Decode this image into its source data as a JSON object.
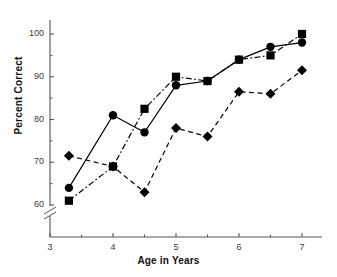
{
  "chart_data": {
    "type": "line",
    "title": "",
    "xlabel": "Age in Years",
    "ylabel": "Percent Correct",
    "xlim": [
      3,
      7.35
    ],
    "ylim": [
      55,
      104
    ],
    "grid": false,
    "legend": "none",
    "axis_break": {
      "axis": "y",
      "present": true,
      "note": "break between 0 and 55 on y-axis"
    },
    "xticks": [
      3,
      4,
      5,
      6,
      7
    ],
    "xtick_labels": [
      "3",
      "4",
      "5",
      "6",
      "7"
    ],
    "xminor_ticks": [
      3.5,
      4.5,
      5.5,
      6.5
    ],
    "yticks": [
      60,
      70,
      80,
      90,
      100
    ],
    "ytick_labels": [
      "60",
      "70",
      "80",
      "90",
      "100"
    ],
    "yminor_ticks": [
      65,
      75,
      85,
      95
    ],
    "x": [
      3.3,
      4.0,
      4.5,
      5.0,
      5.5,
      6.0,
      6.5,
      7.0
    ],
    "series": [
      {
        "name": "circle-series",
        "marker": "circle",
        "linestyle": "solid",
        "color": "#000000",
        "values": [
          64,
          81,
          77,
          88,
          89,
          94,
          97,
          98
        ]
      },
      {
        "name": "square-series",
        "marker": "square",
        "linestyle": "dashdot",
        "color": "#000000",
        "values": [
          61,
          69,
          82.5,
          90,
          89,
          94,
          95,
          100
        ]
      },
      {
        "name": "diamond-series",
        "marker": "diamond",
        "linestyle": "dashed",
        "color": "#000000",
        "values": [
          71.5,
          69,
          63,
          78,
          76,
          86.5,
          86,
          91.5
        ]
      }
    ]
  }
}
